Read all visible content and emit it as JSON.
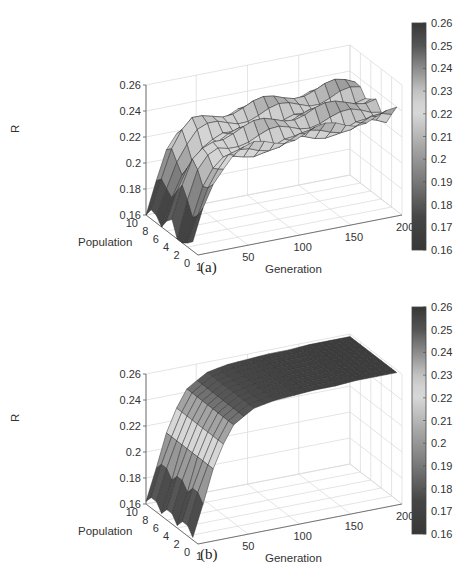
{
  "chart_data": [
    {
      "id": "a",
      "type": "surface3d",
      "caption": "(a)",
      "title": "",
      "xlabel": "Generation",
      "ylabel": "Population",
      "zlabel": "R",
      "x_ticks": [
        "1",
        "50",
        "100",
        "150",
        "200"
      ],
      "y_ticks": [
        "0",
        "2",
        "4",
        "6",
        "8",
        "10"
      ],
      "z_ticks": [
        "0.16",
        "0.18",
        "0.2",
        "0.22",
        "0.24",
        "0.26"
      ],
      "xlim": [
        1,
        200
      ],
      "ylim": [
        0,
        10
      ],
      "zlim": [
        0.16,
        0.26
      ],
      "grid": true,
      "colorbar": {
        "ticks": [
          "0.26",
          "0.25",
          "0.24",
          "0.23",
          "0.22",
          "0.21",
          "0.2",
          "0.19",
          "0.18",
          "0.17",
          "0.16"
        ],
        "range": [
          0.16,
          0.26
        ],
        "position": "right"
      },
      "description": "Surface rises from ~0.17 at generation 1 to ~0.22-0.23 by generation ~40 then stays roughly flat with ridges/valleys across population; jagged low edge near generation 1",
      "generation_samples": [
        1,
        10,
        20,
        30,
        40,
        60,
        80,
        100,
        120,
        140,
        160,
        180,
        200
      ],
      "population_samples": [
        1,
        2,
        3,
        4,
        5,
        6,
        7,
        8,
        9,
        10
      ],
      "r_profile_vs_generation": [
        0.165,
        0.185,
        0.205,
        0.215,
        0.222,
        0.225,
        0.226,
        0.227,
        0.228,
        0.229,
        0.229,
        0.23,
        0.23
      ]
    },
    {
      "id": "b",
      "type": "surface3d",
      "caption": "(b)",
      "title": "",
      "xlabel": "Generation",
      "ylabel": "Population",
      "zlabel": "R",
      "x_ticks": [
        "1",
        "50",
        "100",
        "150",
        "200"
      ],
      "y_ticks": [
        "0",
        "2",
        "4",
        "6",
        "8",
        "10"
      ],
      "z_ticks": [
        "0.16",
        "0.18",
        "0.2",
        "0.22",
        "0.24",
        "0.26"
      ],
      "xlim": [
        1,
        200
      ],
      "ylim": [
        0,
        10
      ],
      "zlim": [
        0.16,
        0.26
      ],
      "grid": true,
      "colorbar": {
        "ticks": [
          "0.26",
          "0.25",
          "0.24",
          "0.23",
          "0.22",
          "0.21",
          "0.2",
          "0.19",
          "0.18",
          "0.17",
          "0.16"
        ],
        "range": [
          0.16,
          0.26
        ],
        "position": "right"
      },
      "description": "Smooth surface rising quickly from ~0.17 at generation 1 to ~0.255 plateau by generation ~60, nearly independent of population",
      "generation_samples": [
        1,
        10,
        20,
        30,
        40,
        60,
        80,
        100,
        120,
        140,
        160,
        180,
        200
      ],
      "population_samples": [
        1,
        2,
        3,
        4,
        5,
        6,
        7,
        8,
        9,
        10
      ],
      "r_profile_vs_generation": [
        0.168,
        0.19,
        0.21,
        0.228,
        0.242,
        0.252,
        0.255,
        0.256,
        0.257,
        0.257,
        0.258,
        0.258,
        0.258
      ]
    }
  ]
}
